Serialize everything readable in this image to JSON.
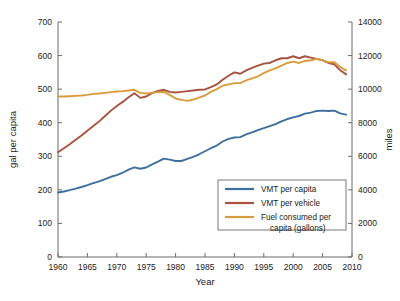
{
  "chart_data": {
    "type": "line",
    "title": "",
    "xlabel": "Year",
    "ylabel": "gal per capita",
    "y2label": "miles",
    "xlim": [
      1960,
      2010
    ],
    "ylim": [
      0,
      700
    ],
    "y2lim": [
      0,
      14000
    ],
    "xticks": [
      1960,
      1965,
      1970,
      1975,
      1980,
      1985,
      1990,
      1995,
      2000,
      2005,
      2010
    ],
    "yticks": [
      0,
      100,
      200,
      300,
      400,
      500,
      600,
      700
    ],
    "y2ticks": [
      0,
      2000,
      4000,
      6000,
      8000,
      10000,
      12000,
      14000
    ],
    "grid": false,
    "legend_position": "lower right",
    "x": [
      1960,
      1961,
      1962,
      1963,
      1964,
      1965,
      1966,
      1967,
      1968,
      1969,
      1970,
      1971,
      1972,
      1973,
      1974,
      1975,
      1976,
      1977,
      1978,
      1979,
      1980,
      1981,
      1982,
      1983,
      1984,
      1985,
      1986,
      1987,
      1988,
      1989,
      1990,
      1991,
      1992,
      1993,
      1994,
      1995,
      1996,
      1997,
      1998,
      1999,
      2000,
      2001,
      2002,
      2003,
      2004,
      2005,
      2006,
      2007,
      2008,
      2009
    ],
    "series": [
      {
        "name": "VMT per capita",
        "color": "#3f6f9f",
        "axis": "right",
        "unit": "miles",
        "values": [
          3840,
          3900,
          3980,
          4070,
          4170,
          4280,
          4400,
          4500,
          4640,
          4780,
          4880,
          5020,
          5200,
          5340,
          5260,
          5330,
          5520,
          5680,
          5860,
          5800,
          5720,
          5720,
          5840,
          5960,
          6120,
          6300,
          6480,
          6640,
          6880,
          7040,
          7120,
          7140,
          7300,
          7420,
          7560,
          7680,
          7800,
          7920,
          8080,
          8220,
          8320,
          8400,
          8540,
          8600,
          8700,
          8720,
          8700,
          8720,
          8560,
          8480
        ]
      },
      {
        "name": "VMT per vehicle",
        "color": "#a9533f",
        "axis": "right",
        "unit": "miles",
        "values": [
          6240,
          6480,
          6720,
          6980,
          7240,
          7520,
          7800,
          8080,
          8400,
          8720,
          9000,
          9240,
          9520,
          9760,
          9480,
          9560,
          9760,
          9900,
          9960,
          9840,
          9800,
          9840,
          9880,
          9920,
          9960,
          9980,
          10120,
          10280,
          10560,
          10800,
          11000,
          10920,
          11120,
          11260,
          11400,
          11520,
          11560,
          11720,
          11840,
          11840,
          11960,
          11840,
          11960,
          11880,
          11800,
          11720,
          11560,
          11480,
          11120,
          10880
        ]
      },
      {
        "name": "Fuel consumed per capita (gallons)",
        "color": "#d99c3d",
        "axis": "left",
        "unit": "gal per capita",
        "values": [
          478,
          478,
          479,
          480,
          481,
          483,
          486,
          487,
          489,
          491,
          493,
          494,
          496,
          498,
          489,
          487,
          489,
          491,
          492,
          483,
          472,
          468,
          465,
          469,
          475,
          481,
          492,
          500,
          510,
          514,
          518,
          518,
          526,
          532,
          538,
          548,
          556,
          562,
          570,
          578,
          582,
          578,
          584,
          586,
          590,
          586,
          580,
          580,
          566,
          556
        ]
      }
    ],
    "legend_entries": [
      {
        "label": "VMT per capita",
        "color": "#3f6f9f"
      },
      {
        "label": "VMT per vehicle",
        "color": "#a9533f"
      },
      {
        "label": "Fuel consumed per",
        "label2": "capita (gallons)",
        "color": "#d99c3d"
      }
    ]
  },
  "legend": {
    "item0": "VMT per capita",
    "item1": "VMT per vehicle",
    "item2_line1": "Fuel consumed per",
    "item2_line2": "capita (gallons)"
  },
  "axes": {
    "x_title": "Year",
    "y_left_title": "gal per capita",
    "y_right_title": "miles"
  }
}
